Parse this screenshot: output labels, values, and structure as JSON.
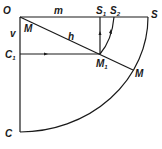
{
  "diagram": {
    "type": "geometry",
    "points": {
      "O": {
        "label": "O",
        "x": 20,
        "y": 17
      },
      "S": {
        "label": "S",
        "x": 148,
        "y": 17
      },
      "S1": {
        "label": "S",
        "sub": "1",
        "x": 100,
        "y": 17
      },
      "S2": {
        "label": "S",
        "sub": "2",
        "x": 114,
        "y": 17
      },
      "C": {
        "label": "C",
        "x": 20,
        "y": 132
      },
      "C1": {
        "label": "C",
        "sub": "1",
        "x": 20,
        "y": 54
      },
      "M1": {
        "label": "M",
        "sub": "1",
        "x": 100,
        "y": 54
      },
      "M": {
        "label": "M",
        "x": 133,
        "y": 70
      },
      "M_near_O": {
        "label": "M"
      }
    },
    "edge_labels": {
      "m": "m",
      "v": "v",
      "h": "h"
    },
    "colors": {
      "stroke": "#1a1a1a",
      "background": "#ffffff"
    }
  }
}
